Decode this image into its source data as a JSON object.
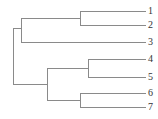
{
  "diagram": {
    "type": "dendrogram",
    "orientation": "left-to-right",
    "line_color": "#8a8a8a",
    "label_color": "#333333",
    "leaves": [
      {
        "label": "1",
        "y": 11
      },
      {
        "label": "2",
        "y": 25
      },
      {
        "label": "3",
        "y": 42
      },
      {
        "label": "4",
        "y": 59
      },
      {
        "label": "5",
        "y": 77
      },
      {
        "label": "6",
        "y": 93
      },
      {
        "label": "7",
        "y": 107
      }
    ],
    "clusters": [
      {
        "members": [
          "1",
          "2"
        ],
        "x": 80
      },
      {
        "members": [
          "1",
          "2",
          "3"
        ],
        "x": 21
      },
      {
        "members": [
          "4",
          "5"
        ],
        "x": 88
      },
      {
        "members": [
          "6",
          "7"
        ],
        "x": 80
      },
      {
        "members": [
          "4",
          "5",
          "6",
          "7"
        ],
        "x": 47
      },
      {
        "members": [
          "1",
          "2",
          "3",
          "4",
          "5",
          "6",
          "7"
        ],
        "x": 13
      }
    ]
  }
}
